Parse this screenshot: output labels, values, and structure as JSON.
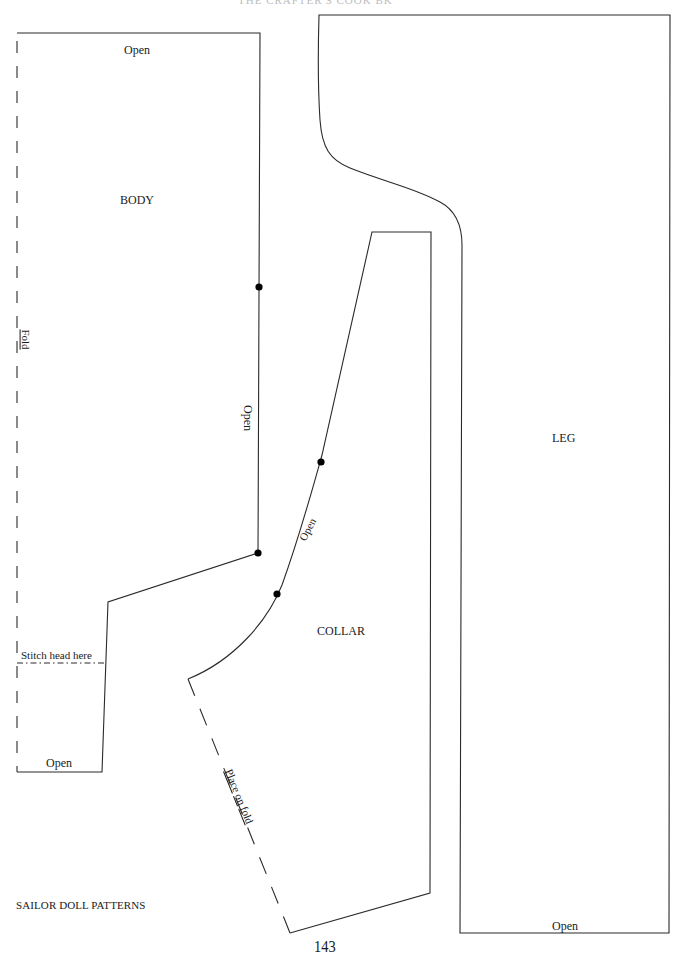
{
  "page": {
    "header_partial": "THE CRAFTER'S COOK BK",
    "footer_title": "SAILOR DOLL PATTERNS",
    "page_number": "143"
  },
  "pieces": {
    "body": {
      "title": "BODY",
      "top_label": "Open",
      "side_label": "Open",
      "fold_label": "Fold",
      "stitch_label": "Stitch head here",
      "bottom_label": "Open"
    },
    "collar": {
      "title": "COLLAR",
      "curve_label": "Open",
      "fold_label_parts": [
        "Place",
        "on",
        "fold"
      ]
    },
    "leg": {
      "title": "LEG",
      "bottom_label": "Open"
    }
  },
  "colors": {
    "line": "#2a2a2a",
    "dot": "#000000",
    "paper": "#ffffff"
  }
}
